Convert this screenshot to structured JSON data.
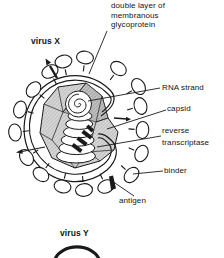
{
  "diagram": {
    "virus_x_label": "virus X",
    "virus_y_label": "virus Y",
    "callouts": {
      "glycoprotein": "double layer of\nmembranous\nglycoprotein",
      "rna_strand": "RNA strand",
      "capsid": "capsid",
      "reverse_transcriptase": "reverse\ntranscriptase",
      "binder": "binder",
      "antigen": "antigen"
    },
    "colors": {
      "ink": "#1a1a1a",
      "capsid_gray": "#d6d6d6",
      "background": "#ffffff"
    }
  }
}
